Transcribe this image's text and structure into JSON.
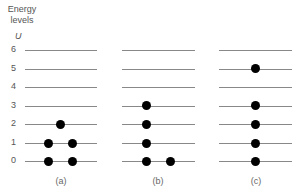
{
  "axis": {
    "title_line1": "Energy",
    "title_line2": "levels",
    "symbol": "U",
    "levels": [
      "0",
      "1",
      "2",
      "3",
      "4",
      "5",
      "6"
    ]
  },
  "panels": [
    {
      "caption": "(a)",
      "occupancy": {
        "0": 2,
        "1": 2,
        "2": 1
      }
    },
    {
      "caption": "(b)",
      "occupancy": {
        "0": 2,
        "1": 1,
        "2": 1,
        "3": 1
      }
    },
    {
      "caption": "(c)",
      "occupancy": {
        "0": 1,
        "1": 1,
        "2": 1,
        "3": 1,
        "5": 1
      }
    }
  ]
}
